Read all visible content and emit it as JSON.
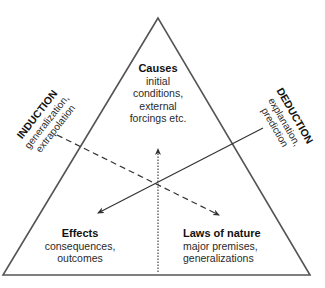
{
  "diagram": {
    "vertices": {
      "top": {
        "title": "Causes",
        "lines": [
          "initial",
          "conditions,",
          "external",
          "forcings etc."
        ]
      },
      "bottom_left": {
        "title": "Effects",
        "lines": [
          "consequences,",
          "outcomes"
        ]
      },
      "bottom_right": {
        "title": "Laws of nature",
        "lines": [
          "major premises,",
          "generalizations"
        ]
      }
    },
    "sides": {
      "left": {
        "title": "INDUCTION",
        "lines": [
          "generalization,",
          "extrapolation"
        ]
      },
      "right": {
        "title": "DEDUCTION",
        "lines": [
          "explanation,",
          "prediction"
        ]
      }
    },
    "arrows": [
      {
        "style": "solid",
        "direction": "toward Effects"
      },
      {
        "style": "dashed",
        "direction": "toward Laws of nature"
      },
      {
        "style": "dotted",
        "direction": "toward Causes"
      }
    ],
    "colors": {
      "line": "#444444",
      "text": "#222222",
      "background": "#ffffff"
    }
  }
}
